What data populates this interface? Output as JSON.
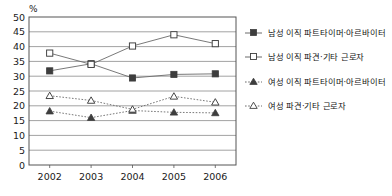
{
  "chart_data": {
    "type": "line",
    "title": "",
    "xlabel": "",
    "ylabel": "%",
    "ylim": [
      0,
      50
    ],
    "ytick_step": 5,
    "grid": true,
    "legend_position": "right",
    "categories": [
      "2002",
      "2003",
      "2004",
      "2005",
      "2006"
    ],
    "yticks": [
      "0",
      "5",
      "10",
      "15",
      "20",
      "25",
      "30",
      "35",
      "40",
      "45",
      "50"
    ],
    "series": [
      {
        "name": "남성 이직 파트타이머·아르바이터",
        "marker": "filled-square",
        "line": "solid",
        "color": "#4d4d4d",
        "values": [
          31.8,
          34.2,
          29.4,
          30.6,
          30.8
        ]
      },
      {
        "name": "남성 이직 파견·기타 근로자",
        "marker": "hollow-square",
        "line": "solid",
        "color": "#4d4d4d",
        "values": [
          37.8,
          34.0,
          40.2,
          44.0,
          41.0
        ]
      },
      {
        "name": "여성 이직 파트타이머·아르바이터",
        "marker": "filled-triangle",
        "line": "dotted",
        "color": "#4d4d4d",
        "values": [
          18.2,
          16.0,
          18.4,
          17.8,
          17.6
        ]
      },
      {
        "name": "여성 파견·기타 근로자",
        "marker": "hollow-triangle",
        "line": "dotted",
        "color": "#4d4d4d",
        "values": [
          23.4,
          21.8,
          18.8,
          23.2,
          21.2
        ]
      }
    ]
  },
  "axis": {
    "unit_label": "%"
  },
  "legend": {
    "items": [
      {
        "label": "남성 이직 파트타이머·아르바이터"
      },
      {
        "label": "남성 이직 파견·기타 근로자"
      },
      {
        "label": "여성 이직 파트타이머·아르바이터"
      },
      {
        "label": "여성 파견·기타 근로자"
      }
    ]
  },
  "colors": {
    "plot_border": "#555555",
    "gridline": "#8a8a8a",
    "marker": "#3d3d3d",
    "line": "#6a6a6a",
    "text": "#1a1a1a",
    "background": "#ffffff"
  }
}
